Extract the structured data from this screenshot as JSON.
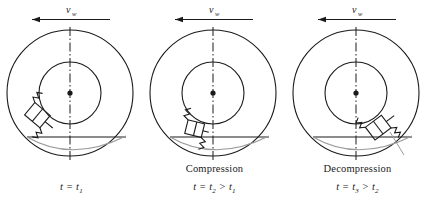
{
  "figure": {
    "background_color": "#ffffff",
    "line_color": "#1a1a1a",
    "ground_curve_color": "#9a9a9a",
    "panel_width": 143,
    "panel_height": 216
  },
  "velocity_arrow": {
    "symbol": "v",
    "subscript": "w",
    "direction": "left",
    "label": "v_w"
  },
  "geometry": {
    "center_x": 70,
    "center_y": 93,
    "outer_radius": 63,
    "inner_radius": 31,
    "ground_y": 137,
    "axis_top": 27,
    "axis_bottom": 160
  },
  "panels": [
    {
      "id": "panel-1",
      "name": "",
      "time_label": "t = t",
      "time_sub": "1",
      "time_rest": "",
      "time_full": "t = t₁",
      "element_angle_deg": 215,
      "element_state": "free",
      "has_state_caption": false
    },
    {
      "id": "panel-2",
      "name": "Compression",
      "time_label": "t = t",
      "time_sub": "2",
      "time_rest": " > t",
      "time_rest_sub": "1",
      "time_full": "t = t₂ > t₁",
      "element_angle_deg": 255,
      "element_state": "compressed",
      "has_state_caption": true
    },
    {
      "id": "panel-3",
      "name": "Decompression",
      "time_label": "t = t",
      "time_sub": "3",
      "time_rest": " > t",
      "time_rest_sub": "2",
      "time_full": "t = t₃ > t₂",
      "element_angle_deg": 300,
      "element_state": "decompressed",
      "has_state_caption": true
    }
  ]
}
